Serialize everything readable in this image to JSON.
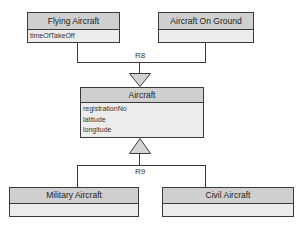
{
  "diagram": {
    "type": "class-diagram",
    "classes": [
      {
        "id": "flying",
        "name": "Flying Aircraft",
        "attributes": [
          "timeOfTakeOff"
        ]
      },
      {
        "id": "ground",
        "name": "Aircraft On Ground",
        "attributes": []
      },
      {
        "id": "aircraft",
        "name": "Aircraft",
        "attributes": [
          "registrationNo",
          "latitude",
          "longitude"
        ]
      },
      {
        "id": "military",
        "name": "Military Aircraft",
        "attributes": []
      },
      {
        "id": "civil",
        "name": "Civil Aircraft",
        "attributes": []
      }
    ],
    "relationships": [
      {
        "label": "R8",
        "type": "generalization",
        "supertype": "Flying Aircraft + Aircraft On Ground",
        "subtype": "Aircraft"
      },
      {
        "label": "R9",
        "type": "generalization",
        "supertype": "Aircraft",
        "subtypes": [
          "Military Aircraft",
          "Civil Aircraft"
        ]
      }
    ],
    "colors": {
      "border": "#3a3a3a",
      "header_fill": "#cfcfcf",
      "body_fill": "#ececec"
    }
  }
}
